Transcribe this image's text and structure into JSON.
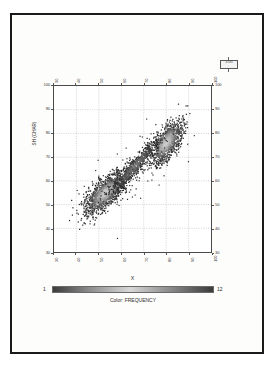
{
  "figure": {
    "kind": "scanned-density-scatter-plot",
    "page_background": "#ffffff",
    "sheet_background": "#fdfdfb",
    "border_color": "#1a1a1a"
  },
  "axes": {
    "ylabel": "SH (CHAR)",
    "xlabel": "X",
    "y_ticks_left": [
      "100",
      "90",
      "80",
      "70",
      "60",
      "50",
      "40",
      "30"
    ],
    "y_ticks_right": [
      "100",
      "90",
      "80",
      "70",
      "60",
      "50",
      "40",
      "30"
    ],
    "x_ticks_top": [
      "30",
      "40",
      "50",
      "60",
      "70",
      "80",
      "90",
      "100"
    ],
    "x_ticks_bottom": [
      "30",
      "40",
      "50",
      "60",
      "70",
      "80",
      "90",
      "100"
    ]
  },
  "colorbar": {
    "min_label": "1",
    "max_label": "12",
    "caption": "Color: FREQUENCY",
    "low_color": "#3b3b3b",
    "mid_color": "#d8d8d8",
    "high_color": "#3b3b3b"
  },
  "corner_note": {
    "line1": "N",
    "line2": "47094",
    "line3": "2861",
    "line4": "0"
  },
  "chart_data": {
    "type": "scatter",
    "title": "",
    "xlabel": "X",
    "ylabel": "SH (CHAR)",
    "xlim": [
      30,
      100
    ],
    "ylim": [
      30,
      100
    ],
    "xticks": [
      30,
      40,
      50,
      60,
      70,
      80,
      90,
      100
    ],
    "yticks": [
      30,
      40,
      50,
      60,
      70,
      80,
      90,
      100
    ],
    "grid": true,
    "legend": "none",
    "colorbar": {
      "label": "FREQUENCY",
      "min": 1,
      "max": 12
    },
    "clusters": [
      {
        "name": "lower-left-cluster",
        "center_x": 53,
        "center_y": 55,
        "angle_deg": 42,
        "semi_major": 12,
        "semi_minor": 5,
        "peak_frequency": 12,
        "n_points": 1400
      },
      {
        "name": "upper-right-cluster",
        "center_x": 80,
        "center_y": 76,
        "angle_deg": 55,
        "semi_major": 11,
        "semi_minor": 5,
        "peak_frequency": 12,
        "n_points": 1150
      },
      {
        "name": "connecting-bridge",
        "center_x": 66,
        "center_y": 66,
        "angle_deg": 47,
        "semi_major": 16,
        "semi_minor": 3,
        "peak_frequency": 6,
        "n_points": 700
      }
    ],
    "outlier_count": 110,
    "correlation": 0.92
  }
}
